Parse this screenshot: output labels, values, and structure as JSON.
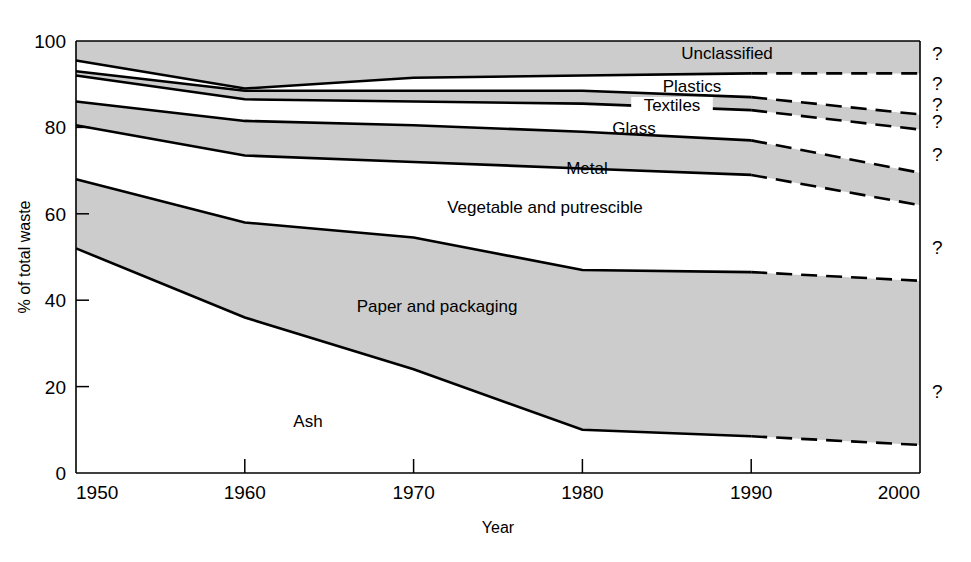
{
  "chart_data": {
    "type": "area",
    "title": "",
    "xlabel": "Year",
    "ylabel": "% of total waste",
    "xlim": [
      1950,
      2000
    ],
    "ylim": [
      0,
      100
    ],
    "grid": false,
    "legend_position": "inline-labels",
    "stacked": true,
    "x": [
      1950,
      1960,
      1970,
      1980,
      1990,
      2000
    ],
    "x_ticks": [
      "1950",
      "1960",
      "1970",
      "1980",
      "1990",
      "2000"
    ],
    "y_ticks": [
      "0",
      "20",
      "40",
      "60",
      "80",
      "100"
    ],
    "projection_note": "Dashed line segments from approximately 1990 to 2000 indicate projected (uncertain) values, flagged with '?' markers at the right edge.",
    "boundaries_cumulative_percent": {
      "ash_top": [
        52,
        36,
        24,
        10,
        8.5,
        6.5
      ],
      "paper_top": [
        68,
        58,
        54.5,
        47,
        46.5,
        44.5
      ],
      "vegetable_top": [
        80.5,
        73.5,
        72,
        70.5,
        69,
        62
      ],
      "metal_top": [
        86,
        81.5,
        80.5,
        79,
        77,
        69.5
      ],
      "glass_top": [
        92,
        86.5,
        86,
        85.5,
        84,
        79.5
      ],
      "textiles_top": [
        93,
        88.5,
        88.5,
        88.5,
        87,
        83
      ],
      "plastics_top": [
        95.5,
        89,
        91.5,
        92,
        92.5,
        92.5
      ],
      "unclassified_top": [
        100,
        100,
        100,
        100,
        100,
        100
      ]
    },
    "series": [
      {
        "name": "Ash",
        "label": "Ash",
        "shaded": false,
        "values": [
          52,
          36,
          24,
          10,
          8.5,
          6.5
        ]
      },
      {
        "name": "Paper and packaging",
        "label": "Paper and packaging",
        "shaded": true,
        "values": [
          16,
          22,
          30.5,
          37,
          38,
          38
        ]
      },
      {
        "name": "Vegetable and putrescible",
        "label": "Vegetable and putrescible",
        "shaded": false,
        "values": [
          12.5,
          15.5,
          17.5,
          23.5,
          22.5,
          17.5
        ]
      },
      {
        "name": "Metal",
        "label": "Metal",
        "shaded": true,
        "values": [
          5.5,
          8,
          8.5,
          8.5,
          8,
          7.5
        ]
      },
      {
        "name": "Glass",
        "label": "Glass",
        "shaded": false,
        "values": [
          6,
          5,
          5.5,
          6.5,
          7,
          10
        ]
      },
      {
        "name": "Textiles",
        "label": "Textiles",
        "shaded": true,
        "values": [
          1,
          2,
          2.5,
          3,
          3,
          3.5
        ]
      },
      {
        "name": "Plastics",
        "label": "Plastics",
        "shaded": false,
        "values": [
          2.5,
          0.5,
          3,
          3.5,
          5.5,
          9.5
        ]
      },
      {
        "name": "Unclassified",
        "label": "Unclassified",
        "shaded": true,
        "values": [
          4.5,
          11,
          8.5,
          8,
          7.5,
          7.5
        ]
      }
    ],
    "uncertainty_markers": [
      "?",
      "?",
      "?",
      "?",
      "?",
      "?",
      "?"
    ]
  },
  "axes": {
    "y_title": "% of total waste",
    "x_title": "Year",
    "x_tick_labels": [
      "1950",
      "1960",
      "1970",
      "1980",
      "1990",
      "2000"
    ],
    "y_tick_labels": [
      "0",
      "20",
      "40",
      "60",
      "80",
      "100"
    ]
  },
  "colors": {
    "shaded_band": "#cccccc",
    "plain_band": "#ffffff",
    "line": "#000000",
    "background": "#ffffff"
  }
}
